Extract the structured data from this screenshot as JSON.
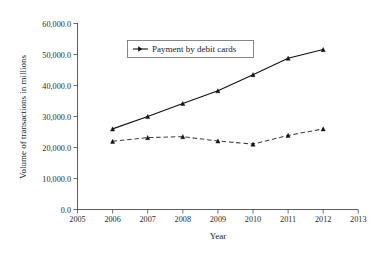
{
  "chart_data": {
    "type": "line",
    "title": "",
    "xlabel": "Year",
    "ylabel": "Volume of transactions in millions",
    "xlim": [
      2005,
      2013
    ],
    "ylim": [
      0,
      60000
    ],
    "grid": false,
    "legend_position": "top-center",
    "x": [
      2006,
      2007,
      2008,
      2009,
      2010,
      2011,
      2012
    ],
    "xticks": [
      "2005",
      "2006",
      "2007",
      "2008",
      "2009",
      "2010",
      "2011",
      "2012",
      "2013"
    ],
    "xtick_values": [
      2005,
      2006,
      2007,
      2008,
      2009,
      2010,
      2011,
      2012,
      2013
    ],
    "yticks": [
      "0.0",
      "10,000.0",
      "20,000.0",
      "30,000.0",
      "40,000.0",
      "50,000.0",
      "60,000.0"
    ],
    "ytick_values": [
      0,
      10000,
      20000,
      30000,
      40000,
      50000,
      60000
    ],
    "series": [
      {
        "name": "Payment by debit cards",
        "style": "solid",
        "marker": "triangle",
        "color": "#111111",
        "in_legend": true,
        "values": [
          26000,
          30000,
          34200,
          38300,
          43500,
          48800,
          51600
        ]
      },
      {
        "name": "",
        "style": "dashed",
        "marker": "triangle",
        "color": "#3d3d3d",
        "in_legend": false,
        "values": [
          22000,
          23200,
          23500,
          22100,
          21100,
          23900,
          26000
        ]
      }
    ],
    "legend": [
      {
        "label": "Payment by debit cards",
        "style": "solid",
        "marker": "triangle",
        "color": "#111111"
      }
    ]
  }
}
